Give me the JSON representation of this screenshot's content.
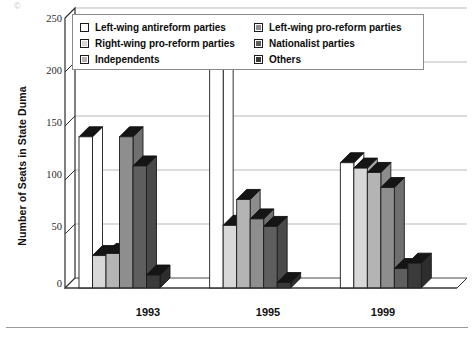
{
  "chart_data": {
    "type": "bar",
    "title": "",
    "subtitle": "",
    "xlabel": "",
    "ylabel": "Number of Seats in State Duma",
    "categories": [
      "1993",
      "1995",
      "1999"
    ],
    "ylim": [
      0,
      250
    ],
    "yticks": [
      0,
      50,
      100,
      150,
      200,
      250
    ],
    "grid": true,
    "legend_position": "top-inside",
    "style": "3d-column",
    "series": [
      {
        "name": "Left-wing antireform parties",
        "color": "#ffffff",
        "values": [
          140,
          206,
          116
        ]
      },
      {
        "name": "Right-wing pro-reform parties",
        "color": "#d8d8d8",
        "values": [
          30,
          58,
          111
        ]
      },
      {
        "name": "Independents",
        "color": "#b4b4b4",
        "values": [
          32,
          82,
          107
        ]
      },
      {
        "name": "Left-wing pro-reform parties",
        "color": "#8e8e8e",
        "values": [
          140,
          64,
          93
        ]
      },
      {
        "name": "Nationalist parties",
        "color": "#5e5e5e",
        "values": [
          113,
          57,
          18
        ]
      },
      {
        "name": "Others",
        "color": "#3a3a3a",
        "values": [
          12,
          5,
          23
        ]
      }
    ]
  },
  "legend": {
    "columns": [
      [
        {
          "label": "Left-wing antireform parties",
          "swatch": "#ffffff"
        },
        {
          "label": "Right-wing pro-reform parties",
          "swatch": "#d8d8d8"
        },
        {
          "label": "Independents",
          "swatch": "#b4b4b4"
        }
      ],
      [
        {
          "label": "Left-wing pro-reform parties",
          "swatch": "#8e8e8e"
        },
        {
          "label": "Nationalist parties",
          "swatch": "#5e5e5e"
        },
        {
          "label": "Others",
          "swatch": "#3a3a3a"
        }
      ]
    ]
  },
  "axes": {
    "y_title": "Number of Seats in State Duma",
    "y_ticks": [
      "250",
      "200",
      "150",
      "100",
      "50",
      "0"
    ],
    "x_ticks": [
      "1993",
      "1995",
      "1999"
    ]
  },
  "marks": {
    "corner_artifact": "©"
  }
}
